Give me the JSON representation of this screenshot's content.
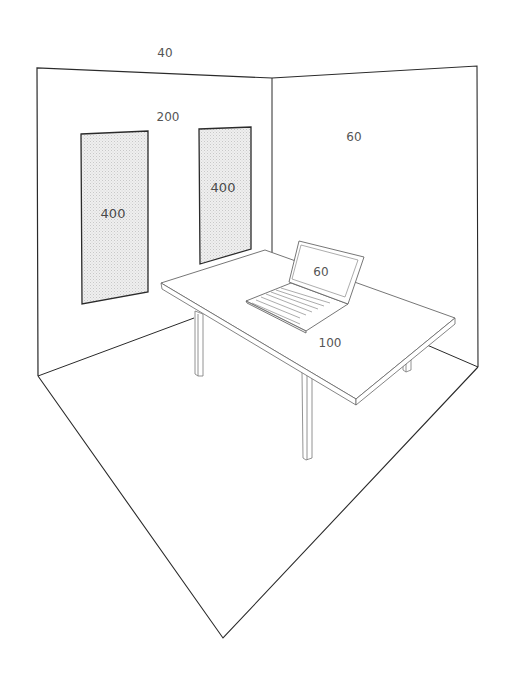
{
  "diagram": {
    "type": "room-illuminance-sketch",
    "colors": {
      "line": "#2a2a2a",
      "light_line": "#777777",
      "window_fill": "#e4e4e4",
      "text": "#555555",
      "background": "#ffffff"
    },
    "labels": {
      "ceiling": "40",
      "left_wall": "200",
      "right_wall": "60",
      "window_left": "400",
      "window_right": "400",
      "laptop_screen": "60",
      "desk_surface": "100"
    }
  }
}
